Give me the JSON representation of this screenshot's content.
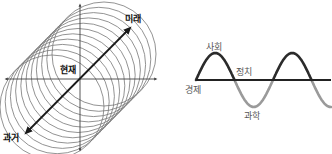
{
  "left_diagram": {
    "title": "time cylinder",
    "labels": {
      "future": "미래",
      "present": "현재",
      "past": "과거"
    },
    "axes": {
      "center": [
        80,
        79
      ],
      "x_range": [
        4,
        158
      ],
      "y_range": [
        3,
        150
      ]
    },
    "time_arrow": {
      "from": [
        26,
        133
      ],
      "to": [
        130,
        28
      ]
    },
    "circles": {
      "count": 11,
      "radius": 52
    },
    "colors": {
      "circle_stroke": "#777777",
      "axis": "#444444",
      "arrow": "#1a1a1a"
    }
  },
  "right_diagram": {
    "title": "social cycle wave",
    "labels": {
      "society": "사회",
      "politics": "정치",
      "economy": "경제",
      "science": "과학"
    },
    "axis": {
      "y": 80,
      "x_start": 196,
      "x_end": 331
    },
    "wave": {
      "x_start": 196,
      "period": 77,
      "amplitude": 27
    },
    "colors": {
      "upper": "#2b2b2b",
      "lower": "#9a9a9a",
      "axis": "#222222"
    }
  }
}
